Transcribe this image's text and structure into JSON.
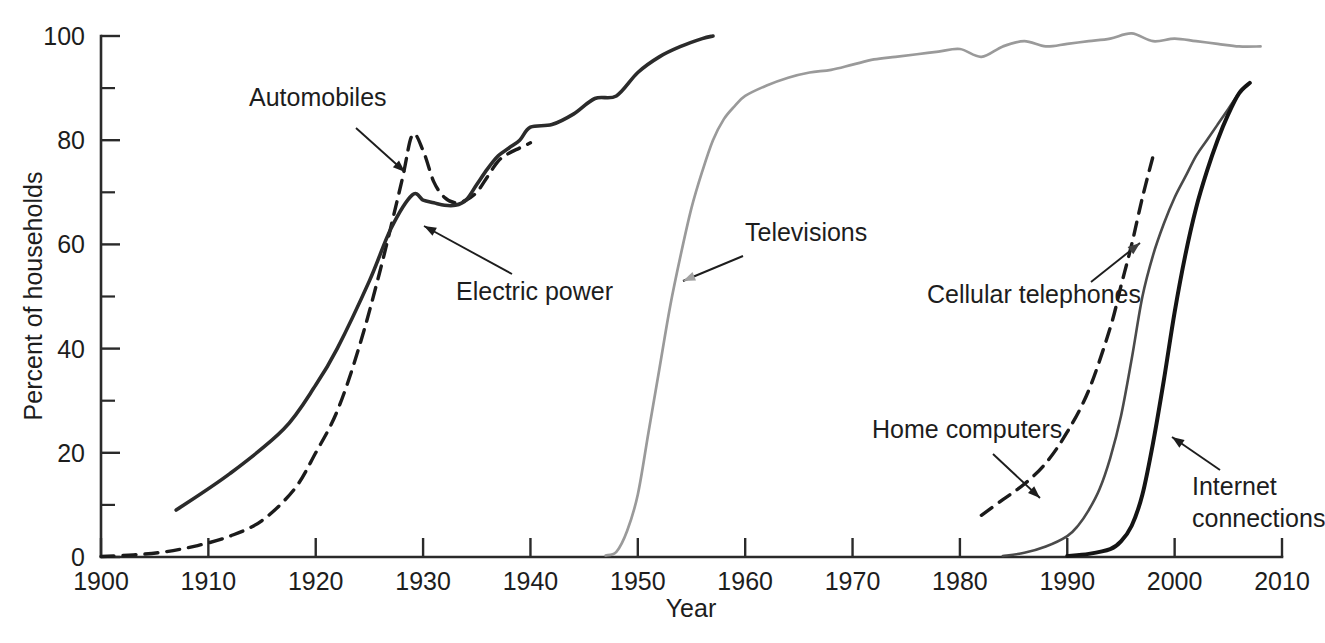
{
  "chart_data": {
    "type": "line",
    "title": "",
    "subtitle": "",
    "xlabel": "Year",
    "ylabel": "Percent of households",
    "xlim": [
      1900,
      2010
    ],
    "ylim": [
      0,
      100
    ],
    "grid": false,
    "legend_position": "inline-annotations",
    "x_ticks_major": [
      1900,
      1910,
      1920,
      1930,
      1940,
      1950,
      1960,
      1970,
      1980,
      1990,
      2000,
      2010
    ],
    "x_tick_labels": [
      "1900",
      "1910",
      "1920",
      "1930",
      "1940",
      "1950",
      "1960",
      "1970",
      "1980",
      "1990",
      "2000",
      "2010"
    ],
    "y_ticks_major": [
      0,
      20,
      40,
      60,
      80,
      100
    ],
    "y_tick_labels": [
      "0",
      "20",
      "40",
      "60",
      "80",
      "100"
    ],
    "y_ticks_minor": [
      10,
      30,
      50,
      70,
      90
    ],
    "series": [
      {
        "name": "Automobiles",
        "style": "dashed",
        "color": "#1b1b1b",
        "width": 3.4,
        "x": [
          1900,
          1903,
          1906,
          1909,
          1912,
          1915,
          1918,
          1920,
          1922,
          1924,
          1926,
          1928,
          1929,
          1930,
          1931,
          1932,
          1933,
          1934,
          1935,
          1936,
          1937,
          1938,
          1939,
          1940
        ],
        "y": [
          0.1,
          0.4,
          1.0,
          2.2,
          4.0,
          7.0,
          13.0,
          20.0,
          28.0,
          40.0,
          55.0,
          72.0,
          81.0,
          78.0,
          72.0,
          69.0,
          68.0,
          68.5,
          70.0,
          73.0,
          76.0,
          77.5,
          78.5,
          79.5
        ]
      },
      {
        "name": "Electric power",
        "style": "solid",
        "color": "#2b2b2b",
        "width": 3.6,
        "x": [
          1907,
          1912,
          1917,
          1920,
          1922,
          1925,
          1927,
          1929,
          1930,
          1931,
          1932,
          1933,
          1934,
          1935,
          1936,
          1937,
          1938,
          1939,
          1940,
          1942,
          1944,
          1946,
          1948,
          1950,
          1952,
          1954,
          1956,
          1957
        ],
        "y": [
          9.0,
          16.0,
          24.5,
          33.0,
          40.0,
          53.0,
          63.0,
          69.5,
          68.5,
          68.0,
          67.5,
          67.5,
          68.5,
          71.5,
          74.5,
          77.0,
          78.5,
          80.0,
          82.5,
          83.0,
          85.0,
          88.0,
          88.5,
          93.0,
          96.0,
          98.0,
          99.5,
          100.0
        ]
      },
      {
        "name": "Televisions",
        "style": "solid",
        "color": "#9a9a9a",
        "width": 2.7,
        "x": [
          1947,
          1948,
          1949,
          1950,
          1951,
          1952,
          1953,
          1954,
          1955,
          1956,
          1957,
          1958,
          1959,
          1960,
          1962,
          1964,
          1966,
          1968,
          1970,
          1972,
          1974,
          1976,
          1978,
          1980,
          1982,
          1984,
          1986,
          1988,
          1990,
          1992,
          1994,
          1996,
          1998,
          2000,
          2002,
          2004,
          2006,
          2008
        ],
        "y": [
          0.3,
          1.0,
          5.0,
          12.0,
          24.0,
          36.0,
          48.0,
          58.0,
          67.0,
          74.0,
          80.0,
          84.0,
          86.5,
          88.5,
          90.5,
          92.0,
          93.0,
          93.5,
          94.5,
          95.5,
          96.0,
          96.5,
          97.0,
          97.5,
          96.0,
          98.0,
          99.0,
          98.0,
          98.5,
          99.0,
          99.5,
          100.5,
          99.0,
          99.5,
          99.0,
          98.5,
          98.0,
          98.0
        ]
      },
      {
        "name": "Cellular telephones",
        "style": "solid",
        "color": "#4a4a4a",
        "width": 2.6,
        "x": [
          1984,
          1986,
          1988,
          1990,
          1991,
          1992,
          1993,
          1994,
          1995,
          1996,
          1997,
          1998,
          1999,
          2000,
          2001,
          2002,
          2003,
          2004,
          2005,
          2006,
          2007
        ],
        "y": [
          0.2,
          0.8,
          2.0,
          4.0,
          6.0,
          9.0,
          13.0,
          19.0,
          27.0,
          38.0,
          50.0,
          58.0,
          64.0,
          69.0,
          73.0,
          77.0,
          80.0,
          83.0,
          86.0,
          89.0,
          91.0
        ]
      },
      {
        "name": "Home computers",
        "style": "dashed",
        "color": "#1b1b1b",
        "width": 3.4,
        "x": [
          1982,
          1984,
          1986,
          1988,
          1990,
          1992,
          1994,
          1995,
          1996,
          1997,
          1998
        ],
        "y": [
          8.0,
          11.0,
          14.0,
          18.0,
          24.0,
          32.0,
          44.0,
          52.0,
          60.0,
          69.0,
          77.0
        ]
      },
      {
        "name": "Internet connections",
        "style": "solid",
        "color": "#141414",
        "width": 4.0,
        "x": [
          1990,
          1992,
          1994,
          1995,
          1996,
          1997,
          1998,
          1999,
          2000,
          2001,
          2002,
          2003,
          2004,
          2005,
          2006,
          2007
        ],
        "y": [
          0.2,
          0.6,
          1.5,
          3.0,
          6.0,
          12.0,
          22.0,
          34.0,
          47.0,
          58.0,
          67.0,
          74.0,
          80.0,
          85.0,
          89.0,
          91.0
        ]
      }
    ],
    "annotations": [
      {
        "label": "Automobiles",
        "color": "#1d1d1d",
        "text_x": 249,
        "text_y": 106,
        "leader_from_x": 356,
        "leader_from_y": 128,
        "leader_to_x": 405,
        "leader_to_y": 172
      },
      {
        "label": "Electric power",
        "color": "#1d1d1d",
        "text_x": 456,
        "text_y": 300,
        "leader_from_x": 512,
        "leader_from_y": 274,
        "leader_to_x": 424,
        "leader_to_y": 226
      },
      {
        "label": "Televisions",
        "color": "#a3a3a3",
        "text_x": 745,
        "text_y": 241,
        "leader_from_x": 743,
        "leader_from_y": 256,
        "leader_to_x": 683,
        "leader_to_y": 281
      },
      {
        "label": "Cellular telephones",
        "color": "#3f3f3f",
        "text_x": 927,
        "text_y": 303,
        "leader_from_x": 1091,
        "leader_from_y": 282,
        "leader_to_x": 1140,
        "leader_to_y": 243
      },
      {
        "label": "Home computers",
        "color": "#1d1d1d",
        "text_x": 872,
        "text_y": 438,
        "leader_from_x": 993,
        "leader_from_y": 454,
        "leader_to_x": 1040,
        "leader_to_y": 498
      },
      {
        "label": "Internet",
        "color": "#1d1d1d",
        "text_x": 1192,
        "text_y": 495,
        "leader_from_x": 1220,
        "leader_from_y": 470,
        "leader_to_x": 1172,
        "leader_to_y": 437
      },
      {
        "label": "connections",
        "color": "#1d1d1d",
        "text_x": 1192,
        "text_y": 527,
        "leader_from_x": null,
        "leader_from_y": null,
        "leader_to_x": null,
        "leader_to_y": null
      }
    ]
  },
  "colors": {
    "axis": "#2a2a2a",
    "text": "#1d1d1d",
    "television_gray": "#9a9a9a",
    "background": "#ffffff"
  },
  "geometry": {
    "plot_left": 101,
    "plot_right": 1282,
    "plot_bottom": 557,
    "plot_top": 36
  }
}
